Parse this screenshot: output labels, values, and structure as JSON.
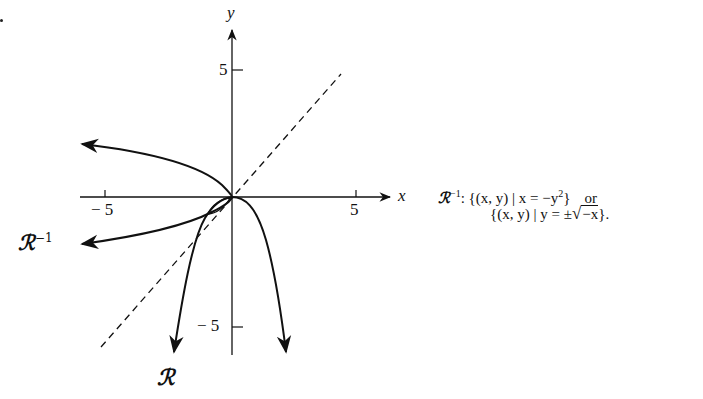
{
  "figure": {
    "axes": {
      "x_label": "x",
      "y_label": "y",
      "x_ticks": [
        {
          "value": -5,
          "label": "− 5"
        },
        {
          "value": 5,
          "label": "5"
        }
      ],
      "y_ticks": [
        {
          "value": 5,
          "label": "5"
        },
        {
          "value": -5,
          "label": "− 5"
        }
      ]
    },
    "curves": [
      {
        "name": "R",
        "label": "ℛ",
        "equation": "y = -x^2",
        "style": "solid"
      },
      {
        "name": "R_inverse",
        "label": "ℛ",
        "superscript": "−1",
        "equation": "x = -y^2",
        "style": "solid"
      },
      {
        "name": "identity",
        "equation": "y = x",
        "style": "dashed"
      }
    ],
    "labels": {
      "R": "ℛ",
      "R_inv_base": "ℛ",
      "R_inv_sup": "−1"
    }
  },
  "annotation": {
    "prefix": "ℛ",
    "prefix_sup": "−1",
    "line1_a": ": {(x, y) | x = −y",
    "line1_sup": "2",
    "line1_b": "}",
    "line1_or": "or",
    "line2_a": "{(x, y) | y = ±",
    "line2_sqrt": "−x",
    "line2_b": "}."
  }
}
